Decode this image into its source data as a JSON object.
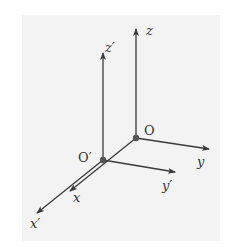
{
  "diagram": {
    "type": "3d-coordinate-frames",
    "background_color": "#f3f3f3",
    "line_color": "#3a3a3a",
    "origins": [
      {
        "id": "O",
        "label": "O",
        "x": 136,
        "y": 138
      },
      {
        "id": "O_prime",
        "label": "O′",
        "x": 103,
        "y": 160
      }
    ],
    "axes": [
      {
        "id": "z",
        "label": "z",
        "from": "O"
      },
      {
        "id": "y",
        "label": "y",
        "from": "O"
      },
      {
        "id": "x",
        "label": "x",
        "from": "O"
      },
      {
        "id": "z_prime",
        "label": "z′",
        "from": "O_prime"
      },
      {
        "id": "y_prime",
        "label": "y′",
        "from": "O_prime"
      },
      {
        "id": "x_prime",
        "label": "x′",
        "from": "O_prime"
      }
    ]
  }
}
